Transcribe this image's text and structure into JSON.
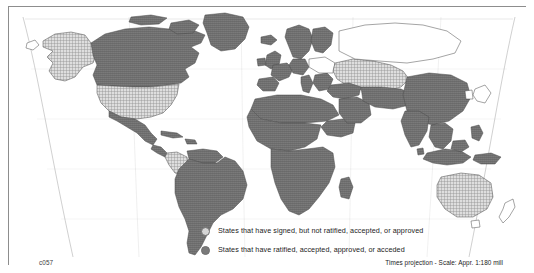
{
  "figure": {
    "plate_code": "c057",
    "projection_note": "Times projection - Scale: Appr. 1:180 mill",
    "frame_color": "#8d8d8d",
    "background_color": "#ffffff"
  },
  "legend": {
    "items": [
      {
        "key": "signed",
        "label": "States that have signed, but not ratified, accepted, or approved",
        "swatch_shape": "circle",
        "fill_color": "#d5d5d5",
        "fill_style": "light-stipple"
      },
      {
        "key": "ratified",
        "label": "States that have ratified, accepted, approved, or acceded",
        "swatch_shape": "circle",
        "fill_color": "#7a7a7a",
        "fill_style": "solid-dark"
      }
    ]
  },
  "map": {
    "projection": "Times",
    "coastline_color": "#4a4a4a",
    "border_color": "#6a6a6a",
    "graticule_color": "#9a9a9a",
    "ocean_color": "#ffffff",
    "unclassified_color": "#ffffff",
    "categories": {
      "ratified": {
        "fill": "#7b7b7b",
        "regions": [
          "Canada",
          "Greenland",
          "Mexico",
          "Central America",
          "Cuba",
          "Brazil",
          "Argentina",
          "Chile",
          "Peru",
          "Bolivia",
          "Venezuela",
          "Ecuador",
          "Paraguay",
          "Uruguay",
          "Guyana",
          "Norway",
          "Sweden",
          "Finland",
          "United Kingdom",
          "Ireland",
          "France",
          "Spain",
          "Portugal",
          "Germany",
          "Italy",
          "Greece",
          "Iceland",
          "Denmark",
          "Netherlands",
          "Belgium",
          "Austria",
          "Morocco",
          "Algeria",
          "Libya",
          "Egypt",
          "Sudan",
          "Ethiopia",
          "Nigeria",
          "Democratic Republic of the Congo",
          "Angola",
          "South Africa",
          "Kenya",
          "Tanzania",
          "Madagascar",
          "Mali",
          "Niger",
          "Chad",
          "Mauritania",
          "Somalia",
          "Zambia",
          "Zimbabwe",
          "Turkey",
          "Iran",
          "Saudi Arabia",
          "Iraq",
          "Syria",
          "Oman",
          "China",
          "India",
          "Pakistan",
          "Myanmar",
          "Thailand",
          "Vietnam",
          "Indonesia",
          "Malaysia",
          "Philippines",
          "Papua New Guinea",
          "Mongolia",
          "Afghanistan",
          "Bangladesh",
          "Sri Lanka"
        ]
      },
      "signed": {
        "fill": "#d5d5d5",
        "regions": [
          "United States of America",
          "Alaska",
          "Colombia",
          "Russia (western)",
          "Ukraine",
          "Kazakhstan",
          "Australia"
        ]
      },
      "unclassified": {
        "fill": "#ffffff",
        "regions": [
          "Russia (Siberia)",
          "Japan",
          "Korea",
          "New Zealand",
          "Central Europe (part)",
          "Antarctica"
        ]
      }
    }
  }
}
